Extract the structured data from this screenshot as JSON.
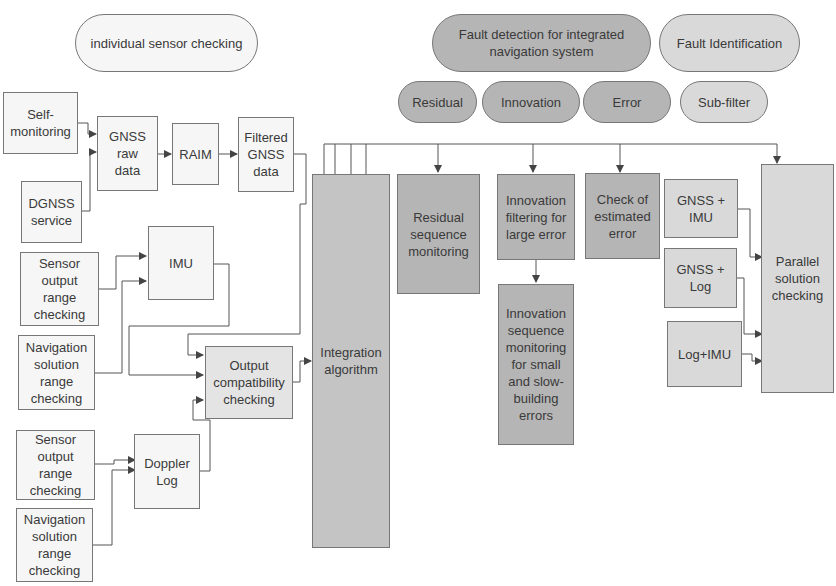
{
  "categories": {
    "individual": "individual sensor checking",
    "fault_detection": "Fault detection for integrated\nnavigation system",
    "fault_identification": "Fault Identification"
  },
  "subcategories": {
    "residual": "Residual",
    "innovation": "Innovation",
    "error": "Error",
    "subfilter": "Sub-filter"
  },
  "nodes": {
    "self_monitoring": "Self-\nmonitoring",
    "dgnss_service": "DGNSS\nservice",
    "gnss_raw": "GNSS\nraw\ndata",
    "raim": "RAIM",
    "filtered_gnss": "Filtered\nGNSS\ndata",
    "sensor_output_1": "Sensor\noutput\nrange\nchecking",
    "nav_solution_1": "Navigation\nsolution\nrange\nchecking",
    "imu": "IMU",
    "output_compat": "Output\ncompatibility\nchecking",
    "sensor_output_2": "Sensor\noutput\nrange\nchecking",
    "nav_solution_2": "Navigation\nsolution\nrange\nchecking",
    "doppler_log": "Doppler\nLog",
    "integration": "Integration\nalgorithm",
    "residual_monitoring": "Residual\nsequence\nmonitoring",
    "innovation_filtering": "Innovation\nfiltering for\nlarge error",
    "innovation_sequence": "Innovation\nsequence\nmonitoring\nfor small\nand slow-\nbuilding\nerrors",
    "check_estimated": "Check of\nestimated\nerror",
    "gnss_imu": "GNSS +\nIMU",
    "gnss_log": "GNSS +\nLog",
    "log_imu": "Log+IMU",
    "parallel": "Parallel\nsolution\nchecking"
  },
  "colors": {
    "line": "#555555",
    "white_box": "#f6f6f6",
    "light_box": "#d9d9d9",
    "mid_box": "#b5b5b5"
  }
}
